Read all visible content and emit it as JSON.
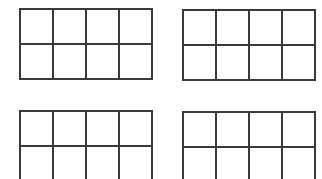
{
  "diagram": {
    "stroke_color": "#3a3a3a",
    "background_color": "#ffffff",
    "grids": [
      {
        "id": "grid-top-left",
        "columns": 4,
        "rows": 2,
        "x": 19,
        "y": 8,
        "cell_width": 33,
        "cell_height": 35,
        "filled_cells": []
      },
      {
        "id": "grid-top-right",
        "columns": 4,
        "rows": 2,
        "x": 182,
        "y": 9,
        "cell_width": 33,
        "cell_height": 35,
        "filled_cells": []
      },
      {
        "id": "grid-bottom-left",
        "columns": 4,
        "rows": 2,
        "x": 19,
        "y": 110,
        "cell_width": 33,
        "cell_height": 35,
        "filled_cells": []
      },
      {
        "id": "grid-bottom-right",
        "columns": 4,
        "rows": 2,
        "x": 182,
        "y": 111,
        "cell_width": 33,
        "cell_height": 35,
        "filled_cells": []
      }
    ]
  }
}
